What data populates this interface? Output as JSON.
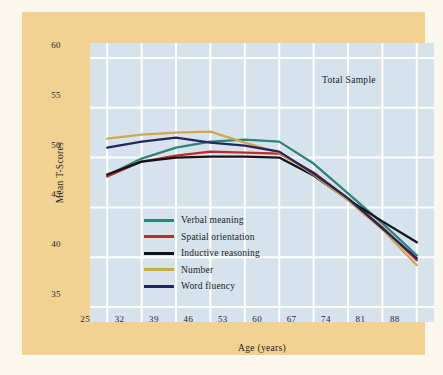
{
  "chart_data": {
    "type": "line",
    "title": "",
    "annotation": "Total Sample",
    "xlabel": "Age (years)",
    "ylabel": "Mean T-Scores",
    "grid": true,
    "legend_position": "inside-lower-left",
    "xlim": [
      21.5,
      91.5
    ],
    "ylim": [
      33.5,
      61.5
    ],
    "xticks": [
      "25",
      "32",
      "39",
      "46",
      "53",
      "60",
      "67",
      "74",
      "81",
      "88"
    ],
    "yticks": [
      "60",
      "55",
      "50",
      "45",
      "40",
      "35"
    ],
    "x": [
      25,
      32,
      39,
      46,
      53,
      60,
      67,
      74,
      81,
      88
    ],
    "series": [
      {
        "name": "Verbal meaning",
        "color": "#2e8479",
        "values": [
          48.2,
          49.9,
          51.0,
          51.6,
          51.8,
          51.6,
          49.4,
          46.4,
          43.4,
          40.2
        ]
      },
      {
        "name": "Spatial orientation",
        "color": "#bf2a2c",
        "values": [
          48.1,
          49.6,
          50.2,
          50.6,
          50.5,
          50.4,
          48.5,
          45.9,
          43.0,
          39.7
        ]
      },
      {
        "name": "Inductive reasoning",
        "color": "#12121a",
        "values": [
          48.3,
          49.6,
          50.0,
          50.1,
          50.1,
          50.0,
          48.2,
          45.8,
          43.6,
          41.5
        ]
      },
      {
        "name": "Number",
        "color": "#cfa84e",
        "values": [
          51.9,
          52.3,
          52.5,
          52.6,
          51.5,
          50.5,
          48.3,
          45.7,
          42.8,
          39.2
        ]
      },
      {
        "name": "Word fluency",
        "color": "#252560",
        "values": [
          51.0,
          51.6,
          52.0,
          51.5,
          51.2,
          50.6,
          48.4,
          45.9,
          42.9,
          39.9
        ]
      }
    ]
  }
}
